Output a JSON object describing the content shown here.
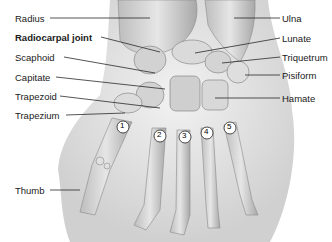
{
  "diagram": {
    "labels_left": [
      {
        "id": "radius",
        "text": "Radius",
        "x": 15,
        "y": 13,
        "bold": false
      },
      {
        "id": "radiocarpal",
        "text": "Radiocarpal joint",
        "x": 15,
        "y": 32,
        "bold": true
      },
      {
        "id": "scaphoid",
        "text": "Scaphoid",
        "x": 15,
        "y": 52,
        "bold": false
      },
      {
        "id": "capitate",
        "text": "Capitate",
        "x": 15,
        "y": 72,
        "bold": false
      },
      {
        "id": "trapezoid",
        "text": "Trapezoid",
        "x": 15,
        "y": 91,
        "bold": false
      },
      {
        "id": "trapezium",
        "text": "Trapezium",
        "x": 15,
        "y": 110,
        "bold": false
      },
      {
        "id": "thumb",
        "text": "Thumb",
        "x": 15,
        "y": 185,
        "bold": false
      }
    ],
    "labels_right": [
      {
        "id": "ulna",
        "text": "Ulna",
        "x": 282,
        "y": 13
      },
      {
        "id": "lunate",
        "text": "Lunate",
        "x": 282,
        "y": 34
      },
      {
        "id": "triquetrum",
        "text": "Triquetrum",
        "x": 282,
        "y": 53
      },
      {
        "id": "pisiform",
        "text": "Pisiform",
        "x": 282,
        "y": 70
      },
      {
        "id": "hamate",
        "text": "Hamate",
        "x": 282,
        "y": 94
      }
    ],
    "metacarpal_numbers": [
      "1",
      "2",
      "3",
      "4",
      "5"
    ],
    "colors": {
      "bone": "#d9d9d9",
      "bone_shadow": "#9a9a9a",
      "skin": "#ececec",
      "line": "#2a2a2a",
      "text": "#1a1a1a"
    }
  }
}
